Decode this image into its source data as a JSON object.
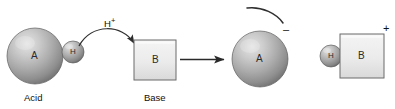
{
  "diagram": {
    "type": "chemistry-reaction-schematic",
    "background_color": "#ffffff",
    "stroke_color": "#3a3a3a",
    "sphere_colors": {
      "highlight": "#d8d8d8",
      "mid": "#a9a9a9",
      "shadow": "#6f6f6f",
      "edge": "#585858"
    },
    "box_colors": {
      "fill_top": "#f2f2f2",
      "fill_bottom": "#dedede",
      "border": "#6b6b6b"
    }
  },
  "reactants": {
    "acid": {
      "sphere_label": "A",
      "caption": "Acid",
      "proton_label": "H"
    },
    "base": {
      "box_label": "B",
      "caption": "Base"
    },
    "transfer_label": "H",
    "transfer_superscript": "+"
  },
  "products": {
    "conjugate_base": {
      "sphere_label": "A",
      "charge": "–"
    },
    "conjugate_acid": {
      "proton_label": "H",
      "box_label": "B",
      "charge": "+"
    }
  },
  "arrows": {
    "curved_proton_transfer": "curved-arrow-icon",
    "reaction_arrow": "reaction-arrow-icon",
    "lone_pair_arc": "electron-arc-icon"
  }
}
